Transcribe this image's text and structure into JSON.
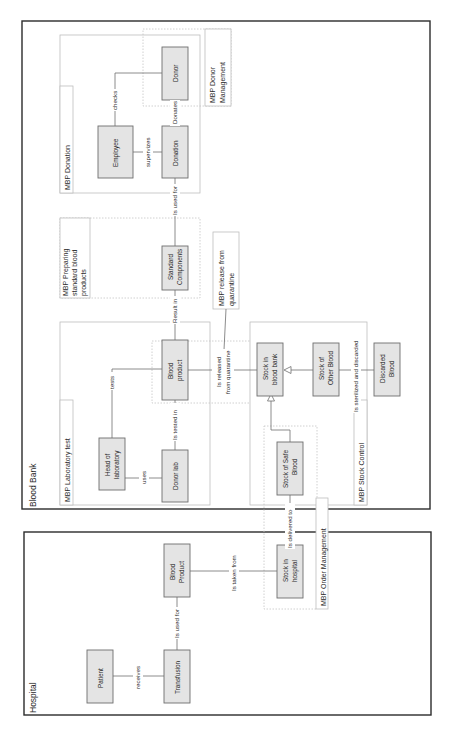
{
  "diagram": {
    "orientation": "rotated-90-ccw",
    "frames": [
      {
        "id": "blood-bank",
        "label": "Blood Bank"
      },
      {
        "id": "hospital",
        "label": "Hospital"
      }
    ],
    "packages": {
      "donation": "MBP Donation",
      "donor_mgmt_l1": "MBP Donor",
      "donor_mgmt_l2": "Management",
      "prep_l1": "MBP Preparing",
      "prep_l2": "standard blood",
      "prep_l3": "products",
      "release_l1": "MBP release from",
      "release_l2": "quarantine",
      "lab": "MBP Laboratory test",
      "stock": "MBP Stock Control",
      "order": "MBP Order Management"
    },
    "entities": {
      "donor": [
        "Donor"
      ],
      "employee": [
        "Employee"
      ],
      "donation": [
        "Donation"
      ],
      "standard_components": [
        "Standard",
        "Components"
      ],
      "blood_product_bb": [
        "Blood",
        "product"
      ],
      "head_lab": [
        "Head of",
        "laboratory"
      ],
      "donor_lab": [
        "Donor lab"
      ],
      "stock_bank": [
        "Stock in",
        "blood bank"
      ],
      "stock_other": [
        "Stock of",
        "Other Blood"
      ],
      "discarded": [
        "Discarded",
        "Blood"
      ],
      "stock_safe": [
        "Stock of Safe",
        "Blood"
      ],
      "patient": [
        "Patient"
      ],
      "transfusion": [
        "Transfusion"
      ],
      "blood_product_h": [
        "Blood",
        "Product"
      ],
      "stock_hospital": [
        "Stock in",
        "hospital"
      ]
    },
    "relations": {
      "checks": "checks",
      "supervizes": "supervizes",
      "donates": "Donates",
      "is_used_for_bb": "Is used for",
      "result_in": "Result in",
      "tests": "tests",
      "uses": "uses",
      "is_tested_in": "Is tested in",
      "released_l1": "Is released",
      "released_l2": "from quarantine",
      "sterilized": "Is sterilized and discarded",
      "delivered": "Is delivered to",
      "taken_from": "Is taken from",
      "receives": "receives",
      "is_used_for_h": "Is used for"
    }
  }
}
